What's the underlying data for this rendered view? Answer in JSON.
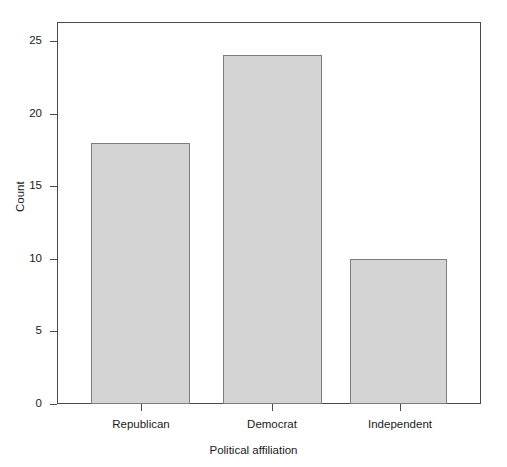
{
  "chart_data": {
    "type": "bar",
    "title": "",
    "subtitle": "",
    "xlabel": "Political affiliation",
    "ylabel": "Count",
    "categories": [
      "Republican",
      "Democrat",
      "Independent"
    ],
    "values": [
      18,
      24,
      10
    ],
    "ylim": [
      0,
      26.3
    ],
    "yticks": [
      0,
      5,
      10,
      15,
      20,
      25
    ],
    "ytick_labels": [
      "0",
      "5",
      "10",
      "15",
      "20",
      "25"
    ],
    "xtick_labels": [
      "Republican",
      "Democrat",
      "Independent"
    ],
    "grid": false,
    "legend": null,
    "legend_position": "none",
    "bar_fill_color": "#d4d4d4",
    "bar_edge_color": "#7d7d7d",
    "frame_color": "#4a4a4a",
    "background_color": "#ffffff",
    "annotations": []
  }
}
